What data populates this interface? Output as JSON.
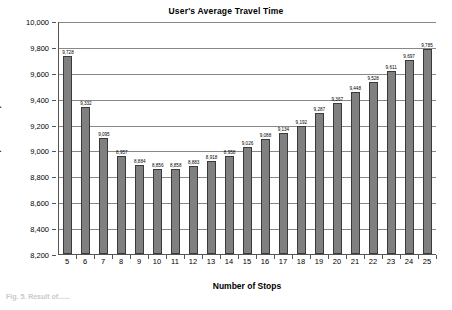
{
  "figure": {
    "caption": "Fig. 5. Result of......"
  },
  "chart_data": {
    "type": "bar",
    "title": "User's Average Travel Time",
    "xlabel": "Number of Stops",
    "ylabel": "Time(in minutes)",
    "ylim": [
      8200,
      10000
    ],
    "ytick_interval": 200,
    "grid": true,
    "legend": null,
    "bar_color": "#808080",
    "bar_edge_color": "#3a3a3a",
    "categories": [
      "5",
      "6",
      "7",
      "8",
      "9",
      "10",
      "11",
      "12",
      "13",
      "14",
      "15",
      "16",
      "17",
      "18",
      "19",
      "20",
      "21",
      "22",
      "23",
      "24",
      "25"
    ],
    "values": [
      9728,
      9332,
      9095,
      8957,
      8884,
      8856,
      8858,
      8883,
      8918,
      8958,
      9026,
      9088,
      9134,
      9192,
      9287,
      9367,
      9448,
      9528,
      9611,
      9697,
      9785
    ],
    "value_labels": [
      "9,728",
      "9,332",
      "9,095",
      "8,957",
      "8,884",
      "8,856",
      "8,858",
      "8,883",
      "8,918",
      "8,958",
      "9,026",
      "9,088",
      "9,134",
      "9,192",
      "9,287",
      "9,367",
      "9,448",
      "9,528",
      "9,611",
      "9,697",
      "9,785"
    ],
    "ytick_labels": [
      "10,000",
      "9,800",
      "9,600",
      "9,400",
      "9,200",
      "9,000",
      "8,800",
      "8,600",
      "8,400",
      "8,200"
    ],
    "ytick_values": [
      10000,
      9800,
      9600,
      9400,
      9200,
      9000,
      8800,
      8600,
      8400,
      8200
    ]
  }
}
